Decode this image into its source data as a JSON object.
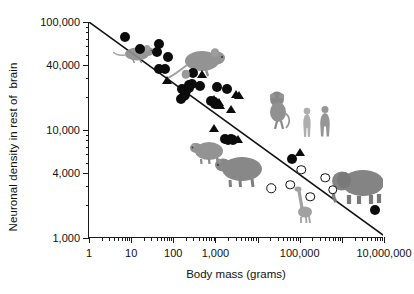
{
  "chart_data": {
    "type": "scatter",
    "title": "",
    "xlabel": "Body mass (grams)",
    "ylabel": "Neuronal density in rest of  brain",
    "xscale": "log",
    "yscale": "log",
    "xlim": [
      1,
      10000000
    ],
    "ylim": [
      1000,
      100000
    ],
    "grid": false,
    "legend_position": "none",
    "xticks": [
      {
        "value": 1,
        "label": "1"
      },
      {
        "value": 10,
        "label": "10"
      },
      {
        "value": 100,
        "label": "100"
      },
      {
        "value": 1000,
        "label": "1,000"
      },
      {
        "value": 10000,
        "label": ""
      },
      {
        "value": 100000,
        "label": "100,000"
      },
      {
        "value": 1000000,
        "label": ""
      },
      {
        "value": 10000000,
        "label": "10,000,000"
      }
    ],
    "yticks": [
      {
        "value": 1000,
        "label": "1,000"
      },
      {
        "value": 4000,
        "label": "4,000"
      },
      {
        "value": 10000,
        "label": "10,000"
      },
      {
        "value": 40000,
        "label": "40,000"
      },
      {
        "value": 100000,
        "label": "100,000"
      }
    ],
    "trendline": {
      "name": "power-law fit",
      "x": [
        1,
        10000000
      ],
      "y": [
        100000,
        1050
      ],
      "color": "#111111"
    },
    "series": [
      {
        "name": "Rodents and other non-primates (filled circles)",
        "marker": "filled-circle",
        "color": "#0c0c0c",
        "points": [
          [
            7,
            72000
          ],
          [
            16,
            56000
          ],
          [
            45,
            62000
          ],
          [
            42,
            53000
          ],
          [
            75,
            47000
          ],
          [
            46,
            36500
          ],
          [
            64,
            36500
          ],
          [
            300,
            34000
          ],
          [
            160,
            24000
          ],
          [
            200,
            23000
          ],
          [
            230,
            24500
          ],
          [
            240,
            26000
          ],
          [
            280,
            26500
          ],
          [
            155,
            19500
          ],
          [
            175,
            20500
          ],
          [
            190,
            21000
          ],
          [
            430,
            25500
          ],
          [
            1100,
            25000
          ],
          [
            1900,
            24000
          ],
          [
            800,
            18500
          ],
          [
            900,
            18000
          ],
          [
            1000,
            17500
          ],
          [
            1700,
            8300
          ],
          [
            2000,
            8100
          ],
          [
            2300,
            8200
          ],
          [
            2600,
            8000
          ],
          [
            65000,
            5400
          ],
          [
            6000000,
            1800
          ]
        ]
      },
      {
        "name": "Primates (filled triangles)",
        "marker": "filled-triangle",
        "color": "#0c0c0c",
        "points": [
          [
            70,
            29000
          ],
          [
            480,
            33000
          ],
          [
            900,
            19500
          ],
          [
            1050,
            18500
          ],
          [
            1200,
            18000
          ],
          [
            1300,
            17000
          ],
          [
            2400,
            15500
          ],
          [
            3100,
            21500
          ],
          [
            3600,
            21000
          ],
          [
            900,
            10500
          ],
          [
            3400,
            8200
          ],
          [
            100000,
            6200
          ]
        ]
      },
      {
        "name": "Large herbivores / artiodactyls (open circles)",
        "marker": "open-circle",
        "color": "#0c0c0c",
        "points": [
          [
            21000,
            2900
          ],
          [
            60000,
            3100
          ],
          [
            110000,
            4300
          ],
          [
            180000,
            2400
          ],
          [
            400000,
            3600
          ],
          [
            600000,
            2800
          ]
        ]
      },
      {
        "name": "Shrew (gray circle)",
        "marker": "gray-circle",
        "color": "#9a9a9a",
        "points": [
          [
            200,
            33000
          ]
        ]
      }
    ],
    "photo_annotations": [
      {
        "name": "mouse-photo",
        "label": "mouse",
        "x": 12,
        "y": 52000
      },
      {
        "name": "rat-photo",
        "label": "rat",
        "x": 350,
        "y": 42000
      },
      {
        "name": "monkey-photo",
        "label": "monkey",
        "x": 30000,
        "y": 15500
      },
      {
        "name": "human-female-photo",
        "label": "human female",
        "x": 150000,
        "y": 11500
      },
      {
        "name": "human-male-photo",
        "label": "human male",
        "x": 400000,
        "y": 11800
      },
      {
        "name": "agouti-photo",
        "label": "agouti",
        "x": 700,
        "y": 6200
      },
      {
        "name": "capybara-photo",
        "label": "capybara",
        "x": 4000,
        "y": 4200
      },
      {
        "name": "giraffe-photo",
        "label": "giraffe",
        "x": 120000,
        "y": 2100
      },
      {
        "name": "elephant-photo",
        "label": "elephant",
        "x": 2500000,
        "y": 3000
      }
    ]
  },
  "figure": {
    "background_color": "#ffffff",
    "axis_color": "#1a1a1a",
    "marker_color": "#0c0c0c"
  }
}
